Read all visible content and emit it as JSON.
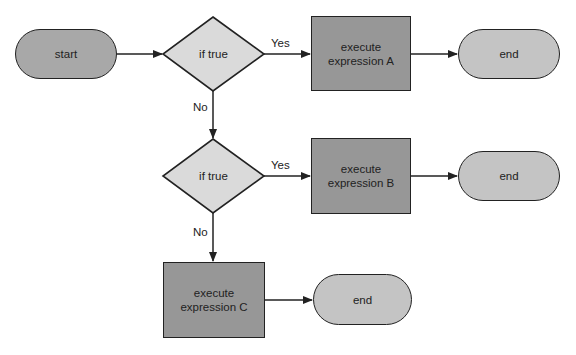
{
  "colors": {
    "start_fill": "#a8a8a8",
    "decision_fill": "#dadada",
    "process_fill": "#979797",
    "end_fill": "#c4c4c4",
    "stroke": "#222222",
    "text": "#222222"
  },
  "nodes": {
    "start": {
      "type": "terminator",
      "label": "start"
    },
    "decision1": {
      "type": "decision",
      "label": "if true"
    },
    "processA": {
      "type": "process",
      "line1": "execute",
      "line2": "expression A"
    },
    "end1": {
      "type": "terminator",
      "label": "end"
    },
    "decision2": {
      "type": "decision",
      "label": "if true"
    },
    "processB": {
      "type": "process",
      "line1": "execute",
      "line2": "expression B"
    },
    "end2": {
      "type": "terminator",
      "label": "end"
    },
    "processC": {
      "type": "process",
      "line1": "execute",
      "line2": "expression C"
    },
    "end3": {
      "type": "terminator",
      "label": "end"
    }
  },
  "edges": [
    {
      "from": "start",
      "to": "decision1",
      "label": ""
    },
    {
      "from": "decision1",
      "to": "processA",
      "label": "Yes"
    },
    {
      "from": "processA",
      "to": "end1",
      "label": ""
    },
    {
      "from": "decision1",
      "to": "decision2",
      "label": "No"
    },
    {
      "from": "decision2",
      "to": "processB",
      "label": "Yes"
    },
    {
      "from": "processB",
      "to": "end2",
      "label": ""
    },
    {
      "from": "decision2",
      "to": "processC",
      "label": "No"
    },
    {
      "from": "processC",
      "to": "end3",
      "label": ""
    }
  ],
  "edge_labels": {
    "yes1": "Yes",
    "no1": "No",
    "yes2": "Yes",
    "no2": "No"
  }
}
